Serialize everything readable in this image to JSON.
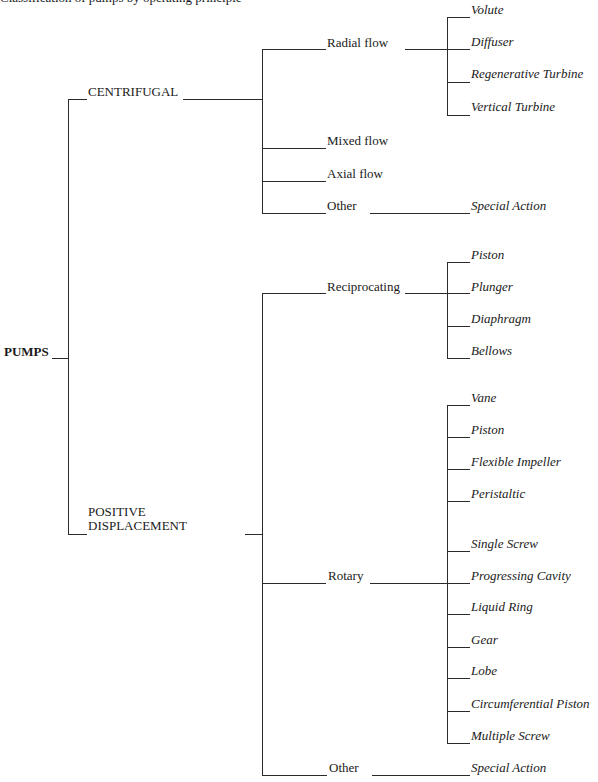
{
  "diagram": {
    "type": "tree",
    "caption_cut_off": "Classification of pumps by operating principle",
    "root": {
      "label": "PUMPS"
    },
    "branches": {
      "centrifugal": {
        "label": "CENTRIFUGAL",
        "children": {
          "radial_flow": {
            "label": "Radial flow",
            "types": [
              "Volute",
              "Diffuser",
              "Regenerative Turbine",
              "Vertical Turbine"
            ]
          },
          "mixed_flow": {
            "label": "Mixed flow"
          },
          "axial_flow": {
            "label": "Axial flow"
          },
          "other": {
            "label": "Other",
            "types": [
              "Special Action"
            ]
          }
        }
      },
      "positive_displacement": {
        "label_line1": "POSITIVE",
        "label_line2": "DISPLACEMENT",
        "children": {
          "reciprocating": {
            "label": "Reciprocating",
            "types": [
              "Piston",
              "Plunger",
              "Diaphragm",
              "Bellows"
            ]
          },
          "rotary": {
            "label": "Rotary",
            "types": [
              "Vane",
              "Piston",
              "Flexible Impeller",
              "Peristaltic",
              "Single Screw",
              "Progressing Cavity",
              "Liquid Ring",
              "Gear",
              "Lobe",
              "Circumferential Piston",
              "Multiple Screw"
            ]
          },
          "other": {
            "label": "Other",
            "types": [
              "Special Action"
            ]
          }
        }
      }
    }
  }
}
